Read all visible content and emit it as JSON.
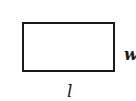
{
  "diagram": {
    "shape": "rectangle",
    "labels": {
      "width": "w",
      "length": "l"
    },
    "colors": {
      "stroke": "#1a1a1a",
      "fill": "#ffffff"
    }
  }
}
